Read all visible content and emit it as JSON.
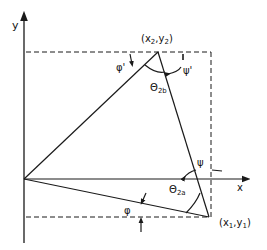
{
  "diagram": {
    "axes": {
      "x_label": "x",
      "y_label": "y"
    },
    "points": {
      "p1": {
        "label_open": "(x",
        "sub1": "1",
        "comma": ",y",
        "sub2": "1",
        "label_close": ")"
      },
      "p2": {
        "label_open": "(x",
        "sub1": "2",
        "comma": ",y",
        "sub2": "2",
        "label_close": ")"
      }
    },
    "angles": {
      "phi": "φ",
      "phi_prime": "φ'",
      "psi": "ψ",
      "psi_prime": "ψ'",
      "theta_2a": {
        "symbol": "Θ",
        "sub": "2a"
      },
      "theta_2b": {
        "symbol": "Θ",
        "sub": "2b"
      }
    },
    "colors": {
      "line": "#1a1a1a",
      "background": "#ffffff"
    }
  }
}
